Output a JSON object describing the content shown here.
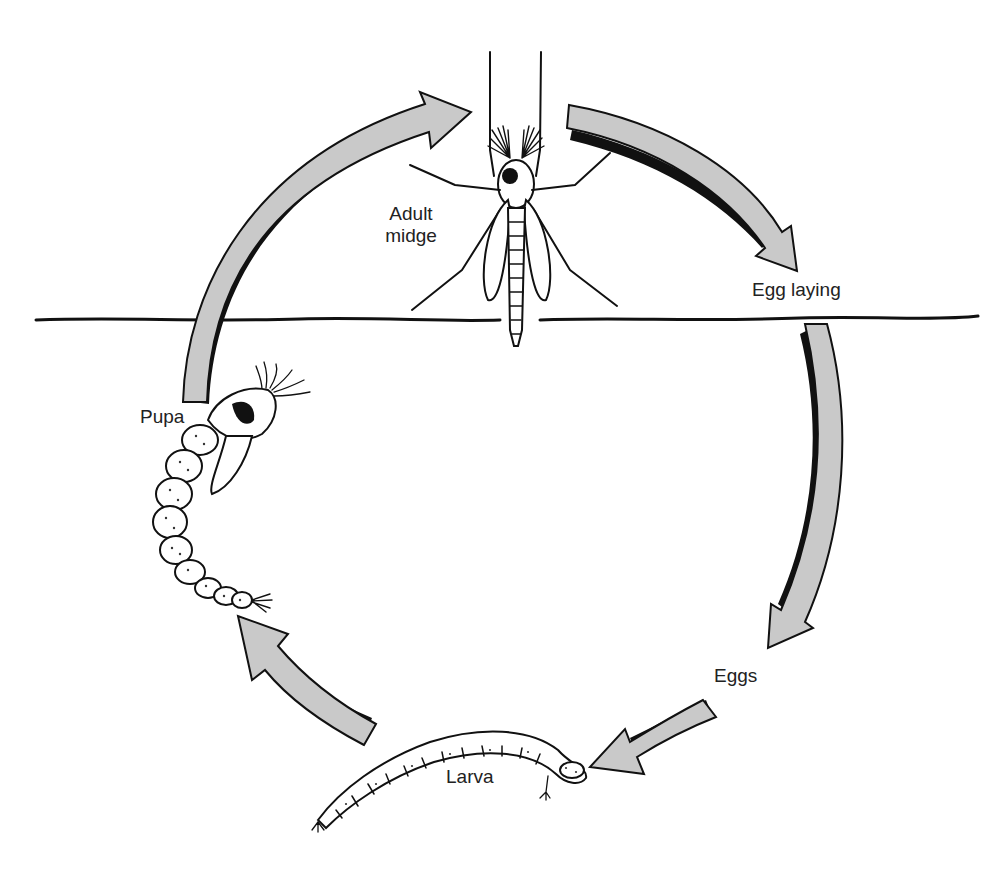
{
  "diagram": {
    "type": "life-cycle",
    "stages": [
      {
        "id": "adult",
        "label_line1": "Adult",
        "label_line2": "midge"
      },
      {
        "id": "egg_laying",
        "label": "Egg laying"
      },
      {
        "id": "eggs",
        "label": "Eggs"
      },
      {
        "id": "larva",
        "label": "Larva"
      },
      {
        "id": "pupa",
        "label": "Pupa"
      }
    ],
    "flow": [
      "adult",
      "egg_laying",
      "eggs",
      "larva",
      "pupa",
      "adult"
    ],
    "water_surface": "horizontal line separating air (above) and water (below)",
    "colors": {
      "arrow_fill": "#c9c9c9",
      "ink": "#111111",
      "background": "#ffffff"
    }
  }
}
